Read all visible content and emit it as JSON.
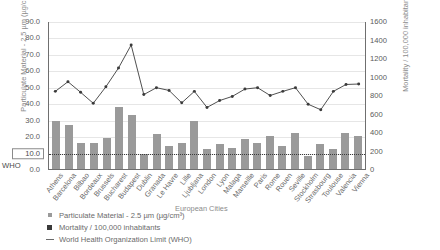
{
  "chart_data": {
    "type": "bar",
    "title": "",
    "xlabel": "European Cities",
    "ylabel": "Particulate Material - 2.5 µm (µg/cm³)",
    "ylabel_right": "Mortality / 100,000 inhabitants",
    "grid": true,
    "legend_position": "bottom-left",
    "ylim": [
      0,
      90
    ],
    "ylim_right": [
      0,
      1600
    ],
    "yticks": [
      "0.0",
      "10.0",
      "20.0",
      "30.0",
      "40.0",
      "50.0",
      "60.0",
      "70.0",
      "80.0",
      "90.0"
    ],
    "yticks_right": [
      "0",
      "200",
      "400",
      "600",
      "800",
      "1000",
      "1200",
      "1400",
      "1600"
    ],
    "who_limit_label": "WHO",
    "who_limit_value": 10,
    "categories": [
      "Athens",
      "Barcelona",
      "Bilbao",
      "Bordeaux",
      "Brussels",
      "Bucharest",
      "Budapest",
      "Dublin",
      "Granada",
      "Le Havre",
      "Lille",
      "Ljubljana",
      "London",
      "Lyon",
      "Malaga",
      "Marseille",
      "Paris",
      "Rome",
      "Rouen",
      "Seville",
      "Stockholm",
      "Strasbourg",
      "Toulouse",
      "Valencia",
      "Vienna"
    ],
    "series": [
      {
        "name": "Particulate Material - 2.5 µm (µg/cm³)",
        "type": "bar",
        "axis": "left",
        "color": "#9a9a9a",
        "values": [
          29,
          27,
          16,
          16,
          19,
          38,
          33,
          9,
          21,
          14,
          16,
          29,
          12,
          15,
          13,
          18,
          16,
          20,
          14,
          22,
          8,
          15,
          12,
          22,
          20
        ]
      },
      {
        "name": "Mortality / 100,000 inhabitants",
        "type": "line",
        "axis": "right",
        "color": "#3a3a3a",
        "values": [
          845,
          950,
          835,
          715,
          895,
          1100,
          1350,
          810,
          885,
          855,
          720,
          845,
          670,
          745,
          790,
          870,
          885,
          800,
          845,
          885,
          705,
          645,
          845,
          920,
          925
        ]
      },
      {
        "name": "World Health Organization Limit (WHO)",
        "type": "hline",
        "axis": "left",
        "color": "#3a3a3a",
        "value": 10
      }
    ]
  },
  "legend": {
    "items": [
      {
        "label": "Particulate Material - 2.5 µm (µg/cm³)",
        "marker": "bar-swatch"
      },
      {
        "label": "Mortality / 100,000 inhabitants",
        "marker": "line-marker-swatch"
      },
      {
        "label": "World Health Organization Limit (WHO)",
        "marker": "dash-swatch"
      }
    ]
  }
}
